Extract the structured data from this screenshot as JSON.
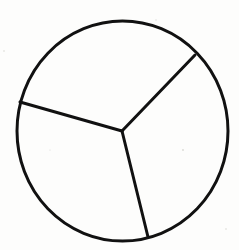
{
  "diagram": {
    "type": "circle-divided-into-sectors",
    "sector_count": 3,
    "stroke_color": "#111111",
    "background_color": "#fdfdfc",
    "stroke_width": 3,
    "circle": {
      "cx": 122.5,
      "cy": 131,
      "rx": 105.5,
      "ry": 110
    },
    "center_point": {
      "x": 122,
      "y": 131
    },
    "spokes": [
      {
        "name": "upper-right",
        "x2": 195,
        "y2": 55
      },
      {
        "name": "left",
        "x2": 20,
        "y2": 102
      },
      {
        "name": "bottom",
        "x2": 148,
        "y2": 237
      }
    ],
    "sectors": [
      {
        "name": "top",
        "approx_angle_deg": 118
      },
      {
        "name": "lower-left",
        "approx_angle_deg": 120
      },
      {
        "name": "right",
        "approx_angle_deg": 122
      }
    ]
  }
}
